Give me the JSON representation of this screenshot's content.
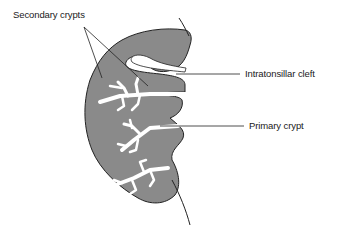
{
  "diagram": {
    "colors": {
      "tissue_fill": "#8a8a8a",
      "outline": "#222222",
      "crypt_fill": "#ffffff",
      "background": "#ffffff"
    },
    "labels": [
      {
        "id": "secondary-crypts",
        "text": "Secondary crypts"
      },
      {
        "id": "intratonsillar-cleft",
        "text": "Intratonsillar cleft"
      },
      {
        "id": "primary-crypt",
        "text": "Primary crypt"
      }
    ]
  }
}
